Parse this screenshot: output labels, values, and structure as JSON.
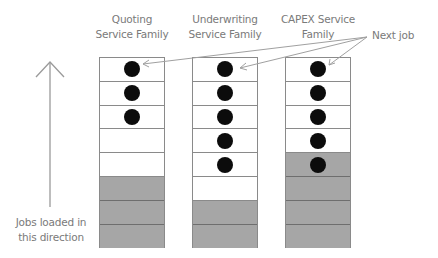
{
  "diagram": {
    "columns": [
      {
        "title_line1": "Quoting",
        "title_line2": "Service Family",
        "cells": [
          {
            "state": "job"
          },
          {
            "state": "job"
          },
          {
            "state": "job"
          },
          {
            "state": "empty"
          },
          {
            "state": "empty"
          },
          {
            "state": "loaded"
          },
          {
            "state": "loaded"
          },
          {
            "state": "loaded"
          }
        ]
      },
      {
        "title_line1": "Underwriting",
        "title_line2": "Service Family",
        "cells": [
          {
            "state": "job"
          },
          {
            "state": "job"
          },
          {
            "state": "job"
          },
          {
            "state": "job"
          },
          {
            "state": "job"
          },
          {
            "state": "empty"
          },
          {
            "state": "loaded"
          },
          {
            "state": "loaded"
          }
        ]
      },
      {
        "title_line1": "CAPEX Service",
        "title_line2": "Family",
        "cells": [
          {
            "state": "job"
          },
          {
            "state": "job"
          },
          {
            "state": "job"
          },
          {
            "state": "job"
          },
          {
            "state": "loaded-job"
          },
          {
            "state": "loaded"
          },
          {
            "state": "loaded"
          },
          {
            "state": "loaded"
          }
        ]
      }
    ],
    "callout": {
      "label": "Next job"
    },
    "direction": {
      "line1": "Jobs loaded in",
      "line2": "this direction",
      "icon": "arrow-up-icon"
    },
    "colors": {
      "text": "#7a7a7a",
      "loaded_fill": "#a6a6a6",
      "job_dot": "#0c0c0c",
      "cell_border": "#8a8a8a",
      "callout_line": "#a0a0a0"
    }
  }
}
